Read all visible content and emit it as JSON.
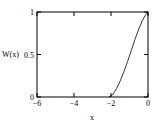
{
  "chart_data": {
    "type": "line",
    "title": "",
    "xlabel": "x",
    "ylabel": "W(x)",
    "xlim": [
      -6,
      0
    ],
    "ylim": [
      0,
      1
    ],
    "grid": false,
    "legend": null,
    "x_ticks": [
      {
        "value": -6,
        "label": "−6"
      },
      {
        "value": -4,
        "label": "−4"
      },
      {
        "value": -2,
        "label": "−2"
      },
      {
        "value": 0,
        "label": "0"
      }
    ],
    "y_ticks": [
      {
        "value": 0,
        "label": "0"
      },
      {
        "value": 0.5,
        "label": "0.5"
      },
      {
        "value": 1,
        "label": "1"
      }
    ],
    "series": [
      {
        "name": "W(x)",
        "color": "#000000",
        "x": [
          -2.1,
          -1.9,
          -1.7,
          -1.5,
          -1.3,
          -1.1,
          -0.9,
          -0.7,
          -0.5,
          -0.3,
          -0.15,
          0
        ],
        "y": [
          0.0,
          0.03,
          0.1,
          0.19,
          0.3,
          0.42,
          0.55,
          0.68,
          0.8,
          0.9,
          0.96,
          1.0
        ]
      }
    ]
  }
}
